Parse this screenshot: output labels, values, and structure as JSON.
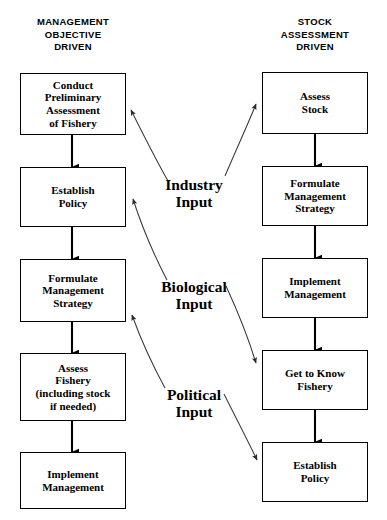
{
  "diagram": {
    "colors": {
      "background": "#ffffff",
      "stroke": "#000000",
      "text": "#000000",
      "connector": "#3a3a3a"
    },
    "columns": {
      "left": {
        "heading": "MANAGEMENT\nOBJECTIVE\nDRIVEN",
        "nodes": [
          {
            "id": "l1",
            "label": "Conduct\nPreliminary\nAssessment\nof Fishery"
          },
          {
            "id": "l2",
            "label": "Establish\nPolicy"
          },
          {
            "id": "l3",
            "label": "Formulate\nManagement\nStrategy"
          },
          {
            "id": "l4",
            "label": "Assess\nFishery\n(including stock\nif needed)"
          },
          {
            "id": "l5",
            "label": "Implement\nManagement"
          }
        ]
      },
      "right": {
        "heading": "STOCK\nASSESSMENT\nDRIVEN",
        "nodes": [
          {
            "id": "r1",
            "label": "Assess\nStock"
          },
          {
            "id": "r2",
            "label": "Formulate\nManagement\nStrategy"
          },
          {
            "id": "r3",
            "label": "Implement\nManagement"
          },
          {
            "id": "r4",
            "label": "Get to Know\nFishery"
          },
          {
            "id": "r5",
            "label": "Establish\nPolicy"
          }
        ]
      }
    },
    "center_labels": [
      {
        "id": "industry",
        "label": "Industry\nInput"
      },
      {
        "id": "biological",
        "label": "Biological\nInput"
      },
      {
        "id": "political",
        "label": "Political\nInput"
      }
    ],
    "flow_arrows": {
      "left_sequence": [
        "l1",
        "l2",
        "l3",
        "l4",
        "l5"
      ],
      "right_sequence": [
        "r1",
        "r2",
        "r3",
        "r4",
        "r5"
      ],
      "direction": "downward"
    },
    "input_connections": [
      {
        "from": "industry",
        "to": "l1",
        "arrowhead": "at-target"
      },
      {
        "from": "industry",
        "to": "r1",
        "arrowhead": "at-target"
      },
      {
        "from": "biological",
        "to": "l3",
        "arrowhead": "at-target"
      },
      {
        "from": "biological",
        "to": "r4",
        "arrowhead": "at-target"
      },
      {
        "from": "political",
        "to": "l4",
        "arrowhead": "at-target"
      },
      {
        "from": "political",
        "to": "r5",
        "arrowhead": "at-target"
      }
    ]
  }
}
